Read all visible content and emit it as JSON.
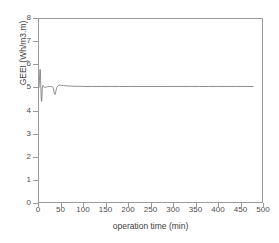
{
  "chart_data": {
    "type": "line",
    "title": "",
    "xlabel": "operation time (min)",
    "ylabel": "GEEI (Wh/m3.m)",
    "xlim": [
      0,
      500
    ],
    "ylim": [
      0,
      8
    ],
    "xticks": [
      0,
      50,
      100,
      150,
      200,
      250,
      300,
      350,
      400,
      450,
      500
    ],
    "yticks": [
      0,
      1,
      2,
      3,
      4,
      5,
      6,
      7,
      8
    ],
    "grid": false,
    "legend": null,
    "series": [
      {
        "name": "GEEI",
        "color": "#6e6e6e",
        "x": [
          0,
          1,
          2,
          2.5,
          3,
          3.5,
          4,
          4.5,
          5,
          5.5,
          6,
          6.5,
          7,
          7.5,
          8,
          9,
          10,
          11,
          12,
          13,
          14,
          15,
          16,
          17,
          18,
          19,
          20,
          22,
          24,
          26,
          28,
          30,
          31,
          32,
          33,
          34,
          35,
          36,
          37,
          38,
          39,
          40,
          42,
          44,
          46,
          48,
          50,
          55,
          60,
          65,
          70,
          80,
          90,
          100,
          120,
          140,
          160,
          180,
          200,
          220,
          240,
          260,
          280,
          300,
          320,
          340,
          360,
          380,
          400,
          420,
          440,
          460,
          480
        ],
        "y": [
          5.0,
          5.3,
          5.72,
          5.8,
          5.72,
          5.45,
          5.1,
          4.8,
          4.55,
          4.42,
          4.4,
          4.55,
          4.8,
          4.97,
          5.06,
          5.1,
          5.08,
          5.04,
          5.01,
          5.0,
          5.0,
          5.01,
          5.02,
          5.03,
          5.04,
          5.04,
          5.05,
          5.05,
          5.05,
          5.05,
          5.05,
          5.04,
          5.02,
          4.98,
          4.88,
          4.78,
          4.72,
          4.7,
          4.76,
          4.86,
          4.95,
          5.01,
          5.07,
          5.1,
          5.11,
          5.11,
          5.1,
          5.09,
          5.08,
          5.07,
          5.07,
          5.06,
          5.06,
          5.05,
          5.05,
          5.05,
          5.05,
          5.05,
          5.05,
          5.05,
          5.05,
          5.05,
          5.05,
          5.05,
          5.05,
          5.05,
          5.05,
          5.05,
          5.05,
          5.05,
          5.05,
          5.05,
          5.05
        ]
      }
    ]
  }
}
